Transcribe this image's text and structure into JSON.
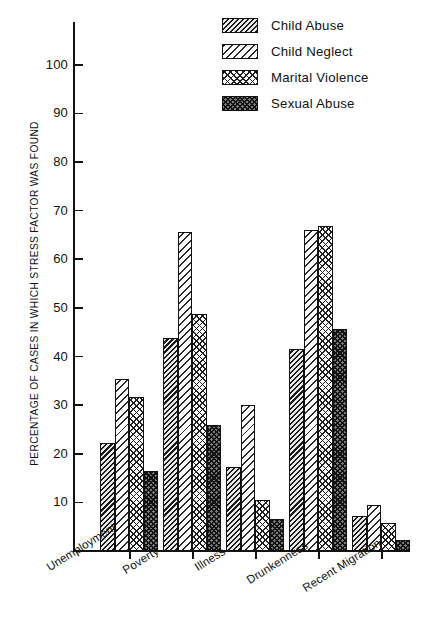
{
  "chart_data": {
    "type": "bar",
    "title": "",
    "xlabel": "",
    "ylabel": "PERCENTAGE OF CASES IN WHICH STRESS FACTOR WAS FOUND",
    "ylim": [
      0,
      108
    ],
    "yticks": [
      10,
      20,
      30,
      40,
      50,
      60,
      70,
      80,
      90,
      100
    ],
    "grid": false,
    "legend_position": "top-right",
    "categories": [
      "Unemployment",
      "Poverty",
      "Illness",
      "Drunkenness",
      "Recent Migration"
    ],
    "series": [
      {
        "name": "Child Abuse",
        "pattern": "dense-dark-diagonal",
        "values": [
          22.3,
          43.8,
          17.2,
          41.6,
          7.2
        ]
      },
      {
        "name": "Child Neglect",
        "pattern": "light-diagonal",
        "values": [
          35.4,
          65.6,
          30.0,
          66.1,
          9.5
        ]
      },
      {
        "name": "Marital Violence",
        "pattern": "light-crosshatch",
        "values": [
          31.6,
          48.7,
          10.4,
          66.8,
          5.8
        ]
      },
      {
        "name": "Sexual Abuse",
        "pattern": "dark-crosshatch",
        "values": [
          16.4,
          25.9,
          6.6,
          45.6,
          2.2
        ]
      }
    ]
  }
}
